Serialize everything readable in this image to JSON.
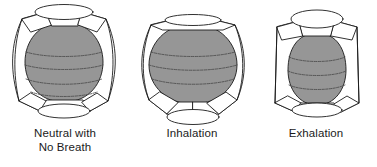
{
  "diagram": {
    "background_color": "#ffffff",
    "stroke_color": "#1b1b1b",
    "lung_fill_color": "#969696",
    "cage_fill_color": "#ffffff",
    "figures": [
      {
        "id": "neutral",
        "caption": "Neutral with\nNo Breath",
        "caption_line1": "Neutral with",
        "caption_line2": "No Breath",
        "description": "barrel-shaped torso, diaphragm level, ribcage neutral"
      },
      {
        "id": "inhalation",
        "caption": "Inhalation",
        "caption_line1": "Inhalation",
        "caption_line2": "",
        "description": "expanded rounded torso, diaphragm descended and flared"
      },
      {
        "id": "exhalation",
        "caption": "Exhalation",
        "caption_line1": "Exhalation",
        "caption_line2": "",
        "description": "narrowed torso, diaphragm raised, ribcage lifted"
      }
    ]
  }
}
